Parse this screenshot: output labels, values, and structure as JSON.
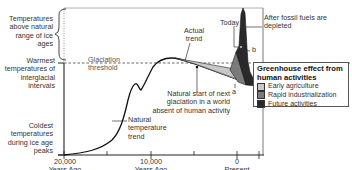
{
  "y_labels": {
    "above_natural": "Temperatures above natural range of ice ages",
    "warmest": "Warmest temperatures of interglacial intervals",
    "coldest": "Coldest temperatures during ice age peaks"
  },
  "annotations": {
    "glaciation_threshold": "Glaciation threshold",
    "actual_trend": "Actual trend",
    "today": "Today",
    "after_fossil_fuels": "After fossil fuels are depleted",
    "point_b": "b",
    "point_a": "a",
    "natural_start": "Natural start of next glaciation in a world absent of human activity",
    "natural_trend": "Natural temperature trend"
  },
  "x_axis": {
    "ticks": [
      {
        "value": "20,000",
        "sub": "Years Ago"
      },
      {
        "value": "10,000",
        "sub": "Years Ago"
      },
      {
        "value": "0",
        "sub": "Present"
      }
    ]
  },
  "legend": {
    "title": "Greenhouse effect from human activities",
    "items": [
      {
        "label": "Early agriculture",
        "color": "#c8c8c8"
      },
      {
        "label": "Rapid industrialization",
        "color": "#7a7a7a"
      },
      {
        "label": "Future activities",
        "color": "#2a2a2a"
      }
    ]
  },
  "colors": {
    "early_agriculture": "#c8c8c8",
    "rapid_industrialization": "#7a7a7a",
    "future_activities": "#2a2a2a",
    "axis": "#222222"
  }
}
